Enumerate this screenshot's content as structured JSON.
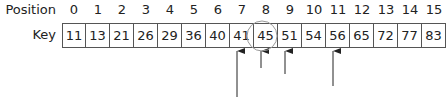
{
  "labels": {
    "position": "Position",
    "key": "Key"
  },
  "positions": [
    "0",
    "1",
    "2",
    "3",
    "4",
    "5",
    "6",
    "7",
    "8",
    "9",
    "10",
    "11",
    "12",
    "13",
    "14",
    "15"
  ],
  "keys": [
    "11",
    "13",
    "21",
    "26",
    "29",
    "36",
    "40",
    "41",
    "45",
    "51",
    "54",
    "56",
    "65",
    "72",
    "77",
    "83"
  ],
  "annotations": {
    "circle": {
      "around_position": 8,
      "cx": 262,
      "cy": 36,
      "r": 15
    },
    "arrows": [
      {
        "position": 7,
        "x": 237,
        "y_from": 97,
        "y_to": 50
      },
      {
        "position": 8,
        "x": 261,
        "y_from": 68,
        "y_to": 50
      },
      {
        "position": 9,
        "x": 285,
        "y_from": 74,
        "y_to": 50
      },
      {
        "position": 11,
        "x": 333,
        "y_from": 86,
        "y_to": 50
      }
    ],
    "stroke_color": "#222222",
    "circle_color": "#999999"
  }
}
